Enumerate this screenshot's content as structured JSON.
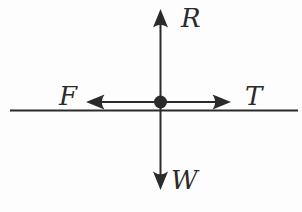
{
  "figure": {
    "type": "free-body-diagram",
    "background_color": "#fdfdfd",
    "ink_color": "#2b2b2b",
    "labels": {
      "up_force": "R",
      "down_force": "W",
      "left_force": "F",
      "right_force": "T"
    },
    "forces": [
      {
        "label": "R",
        "direction": "up"
      },
      {
        "label": "W",
        "direction": "down"
      },
      {
        "label": "F",
        "direction": "left"
      },
      {
        "label": "T",
        "direction": "right"
      }
    ]
  }
}
